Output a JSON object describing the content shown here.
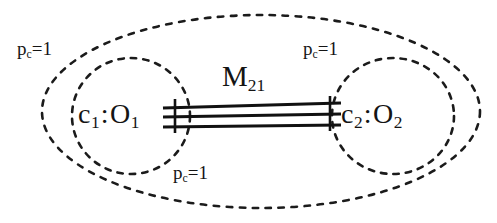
{
  "diagram": {
    "type": "nested-object-collaboration-diagram",
    "background_color": "#ffffff",
    "ink_color": "#141414",
    "outer_container": {
      "shape": "dashed-ellipse",
      "label": {
        "base": "p",
        "subscript": "c",
        "suffix": "=1",
        "full_text": "pc=1"
      }
    },
    "nodes": [
      {
        "id": "left-node",
        "shape": "dashed-circle",
        "label": {
          "instance": "c",
          "instance_subscript": "1",
          "separator": ":",
          "classifier": "O",
          "classifier_subscript": "1",
          "full_text": "c1:O1"
        },
        "annotation": {
          "base": "p",
          "subscript": "c",
          "suffix": "=1",
          "full_text": "pc=1"
        }
      },
      {
        "id": "right-node",
        "shape": "dashed-circle",
        "label": {
          "instance": "c",
          "instance_subscript": "2",
          "separator": ":",
          "classifier": "O",
          "classifier_subscript": "2",
          "full_text": "c2:O2"
        },
        "annotation": {
          "base": "p",
          "subscript": "c",
          "suffix": "=1",
          "full_text": "pc=1"
        }
      }
    ],
    "edge": {
      "id": "edge-m21",
      "style": "triple-solid-line-bundle",
      "line_count": 3,
      "endpoint_ticks": 2,
      "label": {
        "base": "M",
        "subscript": "21",
        "full_text": "M21"
      }
    }
  }
}
